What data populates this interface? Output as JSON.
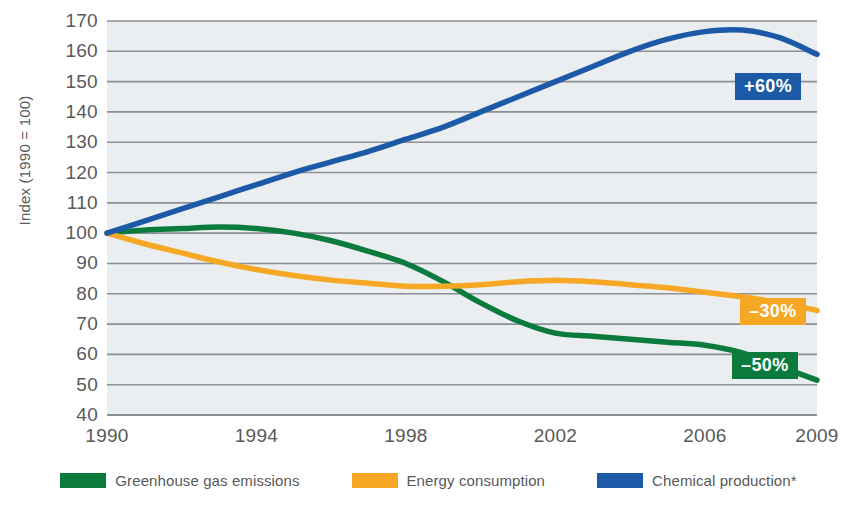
{
  "chart_data": {
    "type": "line",
    "title": "",
    "xlabel": "",
    "ylabel": "Index (1990 = 100)",
    "ylim": [
      40,
      170
    ],
    "xlim": [
      1990,
      2009
    ],
    "grid": true,
    "legend_position": "bottom",
    "yticks": [
      170,
      160,
      150,
      140,
      130,
      120,
      110,
      100,
      90,
      80,
      70,
      60,
      50,
      40
    ],
    "xticks": [
      1990,
      1994,
      1998,
      2002,
      2006,
      2009
    ],
    "x": [
      1990,
      1991,
      1992,
      1993,
      1994,
      1995,
      1996,
      1997,
      1998,
      1999,
      2000,
      2001,
      2002,
      2003,
      2004,
      2005,
      2006,
      2007,
      2008,
      2009
    ],
    "series": [
      {
        "name": "Greenhouse gas emissions",
        "color": "#0a7a3d",
        "values": [
          100,
          101,
          101.5,
          102,
          101.5,
          100,
          97.5,
          94,
          90,
          84,
          77,
          71,
          67,
          66,
          65,
          64,
          63,
          60.5,
          56,
          51.5
        ],
        "end_label": "–50%"
      },
      {
        "name": "Energy consumption",
        "color": "#f6a723",
        "values": [
          100,
          96.5,
          93.5,
          90.5,
          88,
          86,
          84.5,
          83.5,
          82.5,
          82.5,
          83,
          84,
          84.5,
          84,
          83,
          82,
          80.5,
          79,
          77,
          74.5
        ],
        "end_label": "–30%"
      },
      {
        "name": "Chemical production*",
        "color": "#1c5aa8",
        "values": [
          100,
          104,
          108,
          112,
          116,
          120,
          123.5,
          127,
          131,
          135,
          140,
          145,
          150,
          155,
          160,
          164,
          166.5,
          167,
          164.5,
          159
        ],
        "end_label": "+60%"
      }
    ],
    "legend": [
      {
        "label": "Greenhouse gas emissions",
        "color": "#0a7a3d"
      },
      {
        "label": "Energy consumption",
        "color": "#f6a723"
      },
      {
        "label": "Chemical production*",
        "color": "#1c5aa8"
      }
    ],
    "badges": [
      {
        "text": "+60%",
        "color": "#1c5aa8",
        "series": "Chemical production*"
      },
      {
        "text": "–30%",
        "color": "#f6a723",
        "series": "Energy consumption"
      },
      {
        "text": "–50%",
        "color": "#0a7a3d",
        "series": "Greenhouse gas emissions"
      }
    ],
    "plot_background": "#eaeef0",
    "grid_color": "#8c8f93"
  }
}
